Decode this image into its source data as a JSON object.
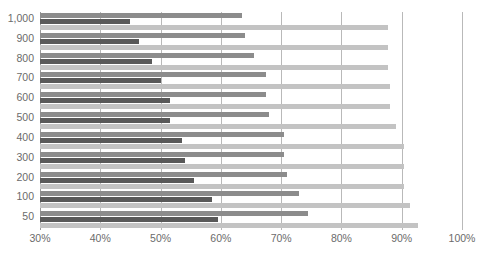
{
  "chart_data": {
    "type": "bar",
    "orientation": "horizontal",
    "title": "",
    "xlabel": "",
    "ylabel": "",
    "xlim": [
      30,
      100
    ],
    "ylim": null,
    "grid": true,
    "legend": null,
    "xticks": [
      "30%",
      "40%",
      "50%",
      "60%",
      "70%",
      "80%",
      "90%",
      "100%"
    ],
    "xtick_values": [
      30,
      40,
      50,
      60,
      70,
      80,
      90,
      100
    ],
    "categories": [
      "1,000",
      "900",
      "800",
      "700",
      "600",
      "500",
      "400",
      "300",
      "200",
      "100",
      "50"
    ],
    "series": [
      {
        "name": "series-medium",
        "color": "#8c8c8c",
        "values": [
          63.5,
          64.0,
          65.5,
          67.5,
          67.5,
          68.0,
          70.5,
          70.5,
          71.0,
          73.0,
          74.5
        ]
      },
      {
        "name": "series-dark",
        "color": "#595959",
        "values": [
          45.0,
          46.5,
          48.5,
          50.0,
          51.5,
          51.5,
          53.5,
          54.0,
          55.5,
          58.5,
          59.5
        ]
      },
      {
        "name": "series-light",
        "color": "#c3c3c3",
        "values": [
          87.7,
          87.7,
          87.7,
          88.1,
          88.1,
          89.1,
          90.4,
          90.4,
          90.4,
          91.4,
          92.7
        ]
      }
    ]
  },
  "axes": {
    "x_tick_labels": [
      "30%",
      "40%",
      "50%",
      "60%",
      "70%",
      "80%",
      "90%",
      "100%"
    ],
    "y_tick_labels": [
      "1,000",
      "900",
      "800",
      "700",
      "600",
      "500",
      "400",
      "300",
      "200",
      "100",
      "50"
    ]
  },
  "colors": {
    "medium": "#8c8c8c",
    "dark": "#595959",
    "light": "#c3c3c3",
    "grid": "#b9b9b9",
    "axis": "#9a9a9a",
    "tick_text": "#6b6b6b",
    "background": "#ffffff"
  },
  "clipped_header": {
    "text": ""
  }
}
